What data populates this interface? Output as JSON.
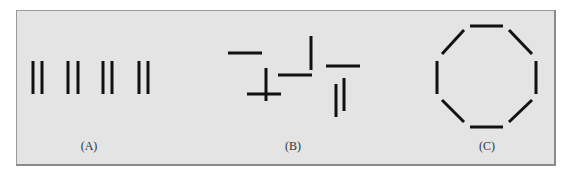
{
  "figure": {
    "background_color": "#e4e4e4",
    "border_color": "#8a8a8a",
    "line_color": "#111111",
    "panels": [
      {
        "id": "A",
        "label": "(A)",
        "label_x": 89,
        "description": "Four pairs of closely spaced vertical lines",
        "segments": [
          {
            "x1": 33,
            "y1": 61,
            "x2": 33,
            "y2": 94
          },
          {
            "x1": 42,
            "y1": 61,
            "x2": 42,
            "y2": 94
          },
          {
            "x1": 68,
            "y1": 61,
            "x2": 68,
            "y2": 94
          },
          {
            "x1": 78,
            "y1": 61,
            "x2": 78,
            "y2": 94
          },
          {
            "x1": 103,
            "y1": 61,
            "x2": 103,
            "y2": 94
          },
          {
            "x1": 112,
            "y1": 61,
            "x2": 112,
            "y2": 94
          },
          {
            "x1": 139,
            "y1": 61,
            "x2": 139,
            "y2": 94
          },
          {
            "x1": 148,
            "y1": 61,
            "x2": 148,
            "y2": 94
          }
        ]
      },
      {
        "id": "B",
        "label": "(B)",
        "label_x": 293,
        "description": "Eight line segments arranged randomly",
        "segments": [
          {
            "x1": 228,
            "y1": 53,
            "x2": 262,
            "y2": 53
          },
          {
            "x1": 266,
            "y1": 68,
            "x2": 266,
            "y2": 101
          },
          {
            "x1": 247,
            "y1": 94,
            "x2": 281,
            "y2": 94
          },
          {
            "x1": 278,
            "y1": 75,
            "x2": 312,
            "y2": 75
          },
          {
            "x1": 311,
            "y1": 36,
            "x2": 311,
            "y2": 70
          },
          {
            "x1": 326,
            "y1": 66,
            "x2": 360,
            "y2": 66
          },
          {
            "x1": 336,
            "y1": 84,
            "x2": 336,
            "y2": 117
          },
          {
            "x1": 344,
            "y1": 78,
            "x2": 344,
            "y2": 111
          }
        ]
      },
      {
        "id": "C",
        "label": "(C)",
        "label_x": 487,
        "description": "Eight line segments arranged as an octagon",
        "segments": [
          {
            "x1": 470,
            "y1": 26,
            "x2": 503,
            "y2": 26
          },
          {
            "x1": 509,
            "y1": 30,
            "x2": 532,
            "y2": 54
          },
          {
            "x1": 536,
            "y1": 61,
            "x2": 536,
            "y2": 94
          },
          {
            "x1": 532,
            "y1": 100,
            "x2": 509,
            "y2": 122
          },
          {
            "x1": 503,
            "y1": 127,
            "x2": 470,
            "y2": 127
          },
          {
            "x1": 464,
            "y1": 122,
            "x2": 442,
            "y2": 100
          },
          {
            "x1": 437,
            "y1": 94,
            "x2": 437,
            "y2": 61
          },
          {
            "x1": 442,
            "y1": 54,
            "x2": 464,
            "y2": 30
          }
        ]
      }
    ]
  }
}
